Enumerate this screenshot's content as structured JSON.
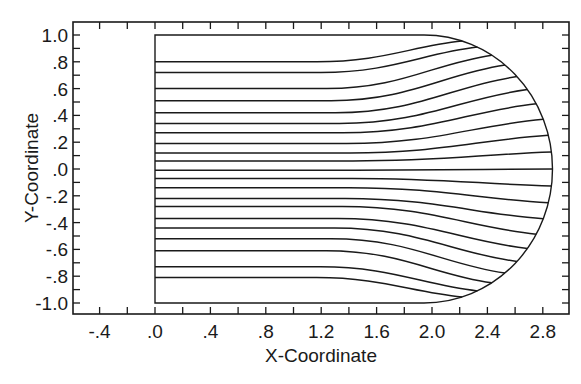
{
  "chart_data": {
    "type": "line",
    "title": "",
    "xlabel": "X-Coordinate",
    "ylabel": "Y-Coordinate",
    "xlim": [
      -0.55,
      3.0
    ],
    "ylim": [
      -1.1,
      1.1
    ],
    "grid": false,
    "legend": null,
    "x_ticks": [
      -0.4,
      0.0,
      0.4,
      0.8,
      1.2,
      1.6,
      2.0,
      2.4,
      2.8
    ],
    "x_tick_labels": [
      "-.4",
      ".0",
      ".4",
      ".8",
      "1.2",
      "1.6",
      "2.0",
      "2.4",
      "2.8"
    ],
    "y_ticks": [
      1.0,
      0.8,
      0.6,
      0.4,
      0.2,
      0.0,
      -0.2,
      -0.4,
      -0.6,
      -0.8,
      -1.0
    ],
    "y_tick_labels": [
      "1.0",
      ".8",
      ".6",
      ".4",
      ".2",
      ".0",
      "-.2",
      "-.4",
      "-.6",
      "-.8",
      "-1.0"
    ],
    "boundary": {
      "inlet_x": 0.0,
      "top_y": 1.0,
      "bottom_y": -1.0,
      "cap_start_x": 2.0,
      "cap_tip_x": 2.87,
      "description": "Rectangular region from x=0 to x≈2.0 closed on the right by a rounded cap reaching x≈2.87 at y=0"
    },
    "streamlines_start_y": [
      0.8,
      0.72,
      0.6,
      0.51,
      0.42,
      0.34,
      0.27,
      0.19,
      0.12,
      0.06,
      -0.01,
      -0.07,
      -0.14,
      -0.22,
      -0.28,
      -0.37,
      -0.44,
      -0.52,
      -0.61,
      -0.73,
      -0.81
    ],
    "series": [
      {
        "name": "streamlines",
        "description": "Horizontal lines from x=0 that stay nearly flat until x≈1.4 and then fan outward to meet the rounded right boundary"
      }
    ]
  }
}
